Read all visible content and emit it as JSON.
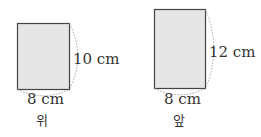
{
  "figures": [
    {
      "name": "top-view",
      "caption": "위",
      "width_label": "8 cm",
      "height_label": "10 cm",
      "fill": "#e6e6e6"
    },
    {
      "name": "front-view",
      "caption": "앞",
      "width_label": "8 cm",
      "height_label": "12 cm",
      "fill": "#e6e6e6"
    }
  ]
}
